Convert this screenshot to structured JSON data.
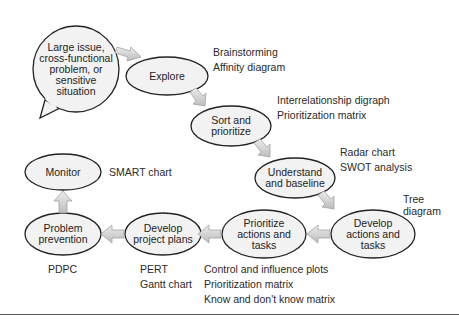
{
  "diagram": {
    "start": "Large issue,\ncross-functional\nproblem, or\nsensitive\nsituation",
    "nodes": [
      {
        "id": "explore",
        "label": "Explore",
        "tools": [
          "Brainstorming",
          "Affinity diagram"
        ]
      },
      {
        "id": "sort",
        "label": "Sort and\nprioritize",
        "tools": [
          "Interrelationship digraph",
          "Prioritization matrix"
        ]
      },
      {
        "id": "understand",
        "label": "Understand\nand baseline",
        "tools": [
          "Radar chart",
          "SWOT analysis"
        ]
      },
      {
        "id": "develop-actions",
        "label": "Develop\nactions and\ntasks",
        "tools": [
          "Tree\ndiagram"
        ]
      },
      {
        "id": "prioritize-actions",
        "label": "Prioritize\nactions and\ntasks",
        "tools": [
          "Control and influence plots",
          "Prioritization matrix",
          "Know and don't know matrix"
        ]
      },
      {
        "id": "develop-plans",
        "label": "Develop\nproject plans",
        "tools": [
          "PERT",
          "Gantt chart"
        ]
      },
      {
        "id": "prevention",
        "label": "Problem\nprevention",
        "tools": [
          "PDPC"
        ]
      },
      {
        "id": "monitor",
        "label": "Monitor",
        "tools": [
          "SMART chart"
        ]
      }
    ],
    "colors": {
      "fill": "#f2f2f2",
      "stroke": "#222222",
      "arrow": "#d4d4d4"
    }
  }
}
